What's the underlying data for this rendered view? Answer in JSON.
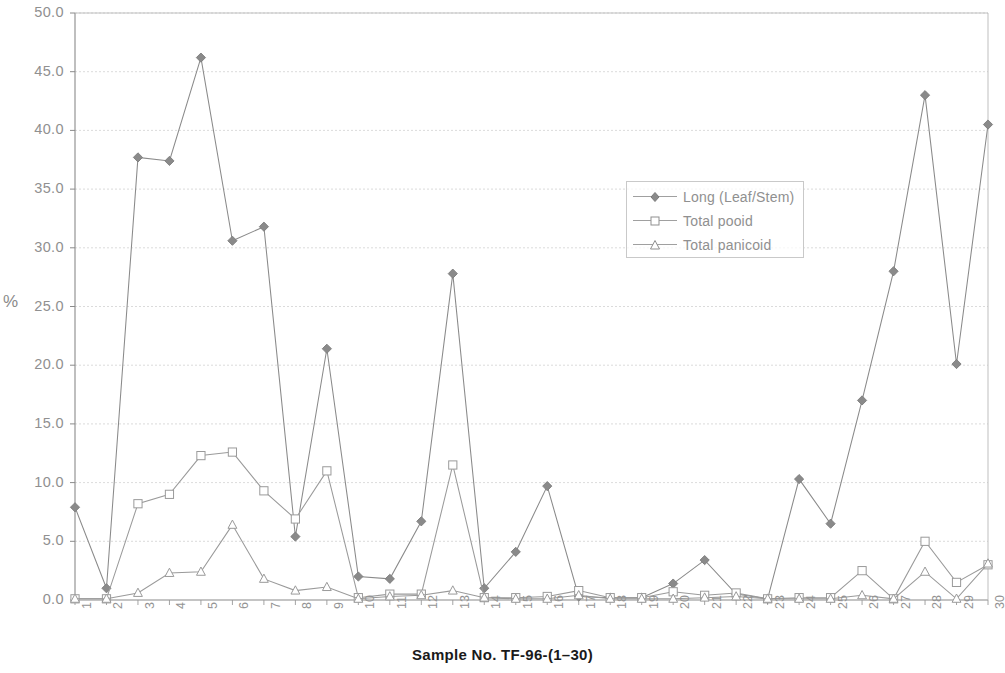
{
  "chart_data": {
    "type": "line",
    "title": "",
    "xlabel": "Sample No. TF-96-(1–30)",
    "ylabel": "%",
    "ylim": [
      0.0,
      50.0
    ],
    "ytick_labels": [
      "0.0",
      "5.0",
      "10.0",
      "15.0",
      "20.0",
      "25.0",
      "30.0",
      "35.0",
      "40.0",
      "45.0",
      "50.0"
    ],
    "ytick_values": [
      0.0,
      5.0,
      10.0,
      15.0,
      20.0,
      25.0,
      30.0,
      35.0,
      40.0,
      45.0,
      50.0
    ],
    "grid": true,
    "legend_position": "upper right inside",
    "categories": [
      "1",
      "2",
      "3",
      "4",
      "5",
      "6",
      "7",
      "8",
      "9",
      "10",
      "11",
      "12",
      "13",
      "14",
      "15",
      "16",
      "17",
      "18",
      "19",
      "20",
      "21",
      "22",
      "23",
      "24",
      "25",
      "26",
      "27",
      "28",
      "29",
      "30"
    ],
    "series": [
      {
        "name": "Long (Leaf/Stem)",
        "marker": "filled-diamond",
        "color": "#8a8a8a",
        "values": [
          7.9,
          1.0,
          37.7,
          37.4,
          46.2,
          30.6,
          31.8,
          5.4,
          21.4,
          2.0,
          1.8,
          6.7,
          27.8,
          1.0,
          4.1,
          9.7,
          0.3,
          0.2,
          0.2,
          1.4,
          3.4,
          0.5,
          0.1,
          10.3,
          6.5,
          17.0,
          28.0,
          43.0,
          20.1,
          40.5
        ]
      },
      {
        "name": "Total pooid",
        "marker": "open-square",
        "color": "#9a9a9a",
        "values": [
          0.1,
          0.1,
          8.2,
          9.0,
          12.3,
          12.6,
          9.3,
          6.9,
          11.0,
          0.2,
          0.5,
          0.5,
          11.5,
          0.2,
          0.2,
          0.3,
          0.8,
          0.2,
          0.2,
          0.7,
          0.4,
          0.6,
          0.1,
          0.2,
          0.2,
          2.5,
          0.1,
          5.0,
          1.5,
          3.0
        ]
      },
      {
        "name": "Total panicoid",
        "marker": "open-triangle",
        "color": "#9a9a9a",
        "values": [
          0.1,
          0.1,
          0.6,
          2.3,
          2.4,
          6.4,
          1.8,
          0.8,
          1.1,
          0.1,
          0.3,
          0.4,
          0.8,
          0.2,
          0.1,
          0.1,
          0.4,
          0.1,
          0.1,
          0.1,
          0.2,
          0.3,
          0.1,
          0.1,
          0.1,
          0.4,
          0.1,
          2.4,
          0.1,
          3.1
        ]
      }
    ]
  },
  "legend": {
    "items": [
      {
        "label": "Long (Leaf/Stem)"
      },
      {
        "label": "Total pooid"
      },
      {
        "label": "Total panicoid"
      }
    ]
  },
  "axes": {
    "y_unit_label": "%",
    "x_title": "Sample No. TF-96-(1–30)"
  }
}
